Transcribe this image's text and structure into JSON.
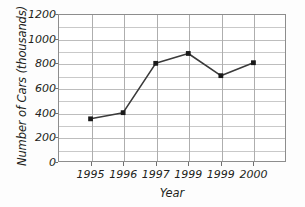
{
  "chart_data": {
    "type": "line",
    "title": "",
    "xlabel": "Year",
    "ylabel": "Number of Cars (thousands)",
    "categories": [
      "1995",
      "1996",
      "1997",
      "1999",
      "1999",
      "2000"
    ],
    "values": [
      350,
      400,
      800,
      880,
      700,
      805
    ],
    "series": [
      {
        "name": "Number of Cars",
        "values": [
          350,
          400,
          800,
          880,
          700,
          805
        ]
      }
    ],
    "ylim": [
      0,
      1200
    ],
    "y_major_ticks": [
      0,
      200,
      400,
      600,
      800,
      1000,
      1200
    ],
    "y_minor_ticks": [
      100,
      300,
      500,
      700,
      900,
      1100
    ],
    "y_tick_labels": [
      "0",
      "200",
      "400",
      "600",
      "800",
      "1000",
      "1200"
    ],
    "grid": true,
    "grid_axis": "both",
    "legend": false,
    "legend_position": "none",
    "marker": "square",
    "line_color": "#3a3a3a",
    "marker_color": "#1a1a1a",
    "grid_color": "#c9c9c9",
    "frame_color": "#8d8d8d",
    "background_color": "#ffffff",
    "text_color": "#231f20"
  }
}
